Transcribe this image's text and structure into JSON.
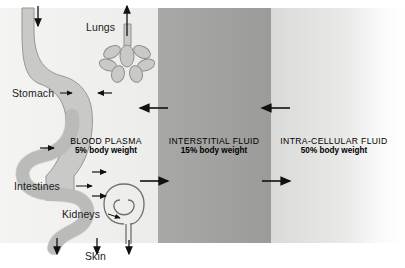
{
  "figure": {
    "type": "physiology-fluid-compartments-diagram",
    "background": "#ffffff"
  },
  "compartments": [
    {
      "id": "blood-plasma",
      "title": "BLOOD PLASMA",
      "subtitle": "5% body weight",
      "color_left": "#f2f2f1",
      "color_right": "#eeeeed",
      "x": 0,
      "width": 157
    },
    {
      "id": "interstitial-fluid",
      "title": "INTERSTITIAL FLUID",
      "subtitle": "15% body weight",
      "color_left": "#a5a5a4",
      "color_right": "#9d9d9c",
      "x": 157,
      "width": 114
    },
    {
      "id": "intra-cellular-fluid",
      "title": "INTRA-CELLULAR FLUID",
      "subtitle": "50% body weight",
      "color_left": "#d9d9d8",
      "color_right": "#ffffff",
      "x": 271,
      "width": 134
    }
  ],
  "organs": [
    {
      "id": "lungs",
      "label": "Lungs"
    },
    {
      "id": "stomach",
      "label": "Stomach"
    },
    {
      "id": "intestines",
      "label": "Intestines"
    },
    {
      "id": "kidneys",
      "label": "Kidneys"
    },
    {
      "id": "skin",
      "label": "Skin"
    }
  ],
  "colors": {
    "organ_fill": "#c9c9c8",
    "organ_stroke": "#8f8f8e",
    "arrow": "#111111",
    "text": "#1b1b1b"
  },
  "exchange_arrows": [
    {
      "id": "plasma-to-interstitial-out",
      "direction": "right",
      "boundary": "plasma/interstitial"
    },
    {
      "id": "interstitial-to-plasma-in",
      "direction": "left",
      "boundary": "plasma/interstitial"
    },
    {
      "id": "interstitial-to-cell-out",
      "direction": "right",
      "boundary": "interstitial/intracellular"
    },
    {
      "id": "cell-to-interstitial-in",
      "direction": "left",
      "boundary": "interstitial/intracellular"
    }
  ],
  "io_arrows": [
    {
      "id": "intake-esophagus",
      "direction": "down"
    },
    {
      "id": "lung-exhalation",
      "direction": "up"
    },
    {
      "id": "gut-loss",
      "direction": "down"
    },
    {
      "id": "skin-loss",
      "direction": "down"
    },
    {
      "id": "urine-loss",
      "direction": "down"
    }
  ]
}
